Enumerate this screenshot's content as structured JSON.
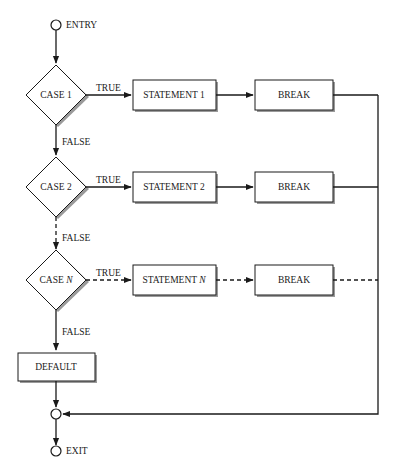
{
  "diagram": {
    "type": "flowchart",
    "entry_label": "ENTRY",
    "exit_label": "EXIT",
    "cases": [
      {
        "label": "CASE 1",
        "true_label": "TRUE",
        "false_label": "FALSE",
        "statement": "STATEMENT 1",
        "break": "BREAK",
        "dashed": false
      },
      {
        "label": "CASE 2",
        "true_label": "TRUE",
        "false_label": "FALSE",
        "statement": "STATEMENT 2",
        "break": "BREAK",
        "dashed": false
      },
      {
        "label_prefix": "CASE ",
        "label_var": "N",
        "true_label": "TRUE",
        "false_label": "FALSE",
        "statement_prefix": "STATEMENT ",
        "statement_var": "N",
        "break": "BREAK",
        "dashed": true
      }
    ],
    "default_label": "DEFAULT",
    "colors": {
      "stroke": "#1a1a1a",
      "shadow": "#9a9a9a",
      "background": "#ffffff"
    }
  }
}
